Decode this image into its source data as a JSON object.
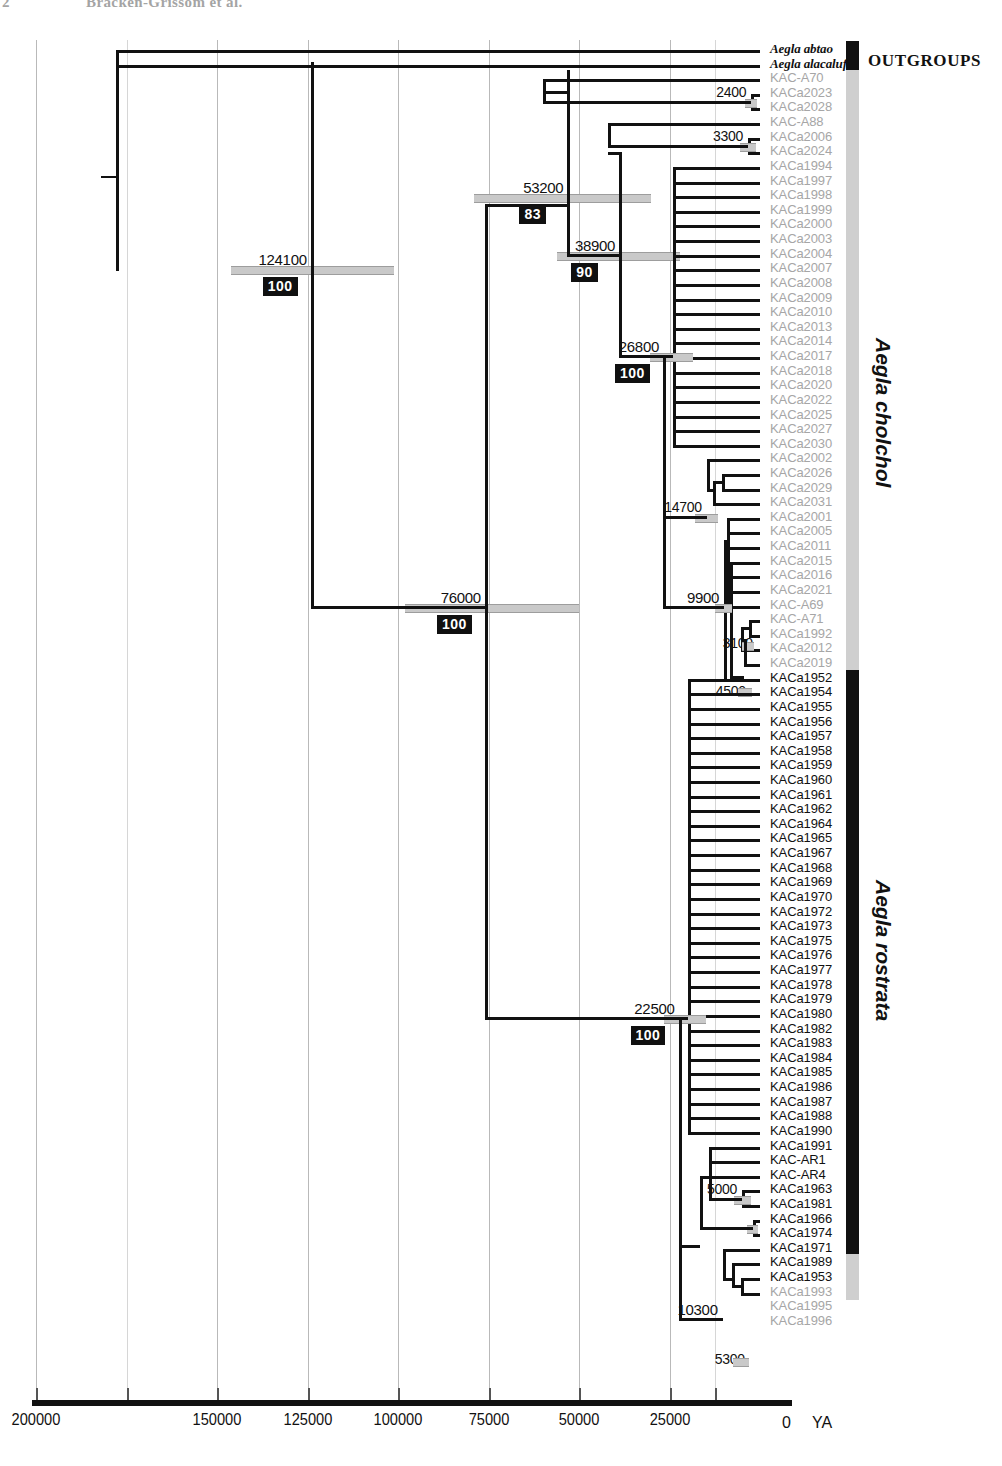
{
  "running_head": {
    "page_number": "2",
    "text": "Bracken-Grissom et al."
  },
  "figure": {
    "type": "phylogenetic-time-tree",
    "axis": {
      "unit_label": "YA",
      "zero_label": "0",
      "ticks": [
        {
          "label": "200000",
          "value": 200000
        },
        {
          "label": "150000",
          "value": 150000
        },
        {
          "label": "125000",
          "value": 125000
        },
        {
          "label": "100000",
          "value": 100000
        },
        {
          "label": "75000",
          "value": 75000
        },
        {
          "label": "50000",
          "value": 50000
        },
        {
          "label": "25000",
          "value": 25000
        }
      ],
      "min": 0,
      "max": 200000,
      "direction": "right-to-left-past-to-present"
    },
    "clades": [
      {
        "name": "OUTGROUPS",
        "label": "OUTGROUPS",
        "bar_color": "#111111",
        "orientation": "horizontal"
      },
      {
        "name": "Aegla cholchol",
        "label": "Aegla cholchol",
        "bar_color": "#cfcfcf",
        "orientation": "vertical"
      },
      {
        "name": "Aegla rostrata",
        "label": "Aegla rostrata",
        "bar_color": "#111111",
        "orientation": "vertical"
      }
    ],
    "node_ages": [
      {
        "id": "root",
        "label": "124100",
        "support": "100"
      },
      {
        "id": "cholchol-stem",
        "label": "53200",
        "support": "83"
      },
      {
        "id": "cholchol-core",
        "label": "38900",
        "support": "90"
      },
      {
        "id": "cholchol-sub",
        "label": "26800",
        "support": "100"
      },
      {
        "id": "cholchol-rostrata-split",
        "label": "76000",
        "support": "100"
      },
      {
        "id": "rostrata-crown",
        "label": "22500",
        "support": "100"
      },
      {
        "id": "node-2400",
        "label": "2400",
        "support": ""
      },
      {
        "id": "node-3300",
        "label": "3300",
        "support": ""
      },
      {
        "id": "node-14700",
        "label": "14700",
        "support": ""
      },
      {
        "id": "node-9900",
        "label": "9900",
        "support": ""
      },
      {
        "id": "node-3100",
        "label": "3100",
        "support": ""
      },
      {
        "id": "node-4500",
        "label": "4500",
        "support": ""
      },
      {
        "id": "node-5000",
        "label": "5000",
        "support": ""
      },
      {
        "id": "node-10300",
        "label": "10300",
        "support": ""
      },
      {
        "id": "node-5300",
        "label": "5300",
        "support": ""
      }
    ],
    "tips": [
      {
        "label": "Aegla abtao",
        "style": "outgroup"
      },
      {
        "label": "Aegla alacalufi",
        "style": "outgroup"
      },
      {
        "label": "KAC-A70",
        "style": "grey"
      },
      {
        "label": "KACa2023",
        "style": "grey"
      },
      {
        "label": "KACa2028",
        "style": "grey"
      },
      {
        "label": "KAC-A88",
        "style": "grey"
      },
      {
        "label": "KACa2006",
        "style": "grey"
      },
      {
        "label": "KACa2024",
        "style": "grey"
      },
      {
        "label": "KACa1994",
        "style": "grey"
      },
      {
        "label": "KACa1997",
        "style": "grey"
      },
      {
        "label": "KACa1998",
        "style": "grey"
      },
      {
        "label": "KACa1999",
        "style": "grey"
      },
      {
        "label": "KACa2000",
        "style": "grey"
      },
      {
        "label": "KACa2003",
        "style": "grey"
      },
      {
        "label": "KACa2004",
        "style": "grey"
      },
      {
        "label": "KACa2007",
        "style": "grey"
      },
      {
        "label": "KACa2008",
        "style": "grey"
      },
      {
        "label": "KACa2009",
        "style": "grey"
      },
      {
        "label": "KACa2010",
        "style": "grey"
      },
      {
        "label": "KACa2013",
        "style": "grey"
      },
      {
        "label": "KACa2014",
        "style": "grey"
      },
      {
        "label": "KACa2017",
        "style": "grey"
      },
      {
        "label": "KACa2018",
        "style": "grey"
      },
      {
        "label": "KACa2020",
        "style": "grey"
      },
      {
        "label": "KACa2022",
        "style": "grey"
      },
      {
        "label": "KACa2025",
        "style": "grey"
      },
      {
        "label": "KACa2027",
        "style": "grey"
      },
      {
        "label": "KACa2030",
        "style": "grey"
      },
      {
        "label": "KACa2002",
        "style": "grey"
      },
      {
        "label": "KACa2026",
        "style": "grey"
      },
      {
        "label": "KACa2029",
        "style": "grey"
      },
      {
        "label": "KACa2031",
        "style": "grey"
      },
      {
        "label": "KACa2001",
        "style": "grey"
      },
      {
        "label": "KACa2005",
        "style": "grey"
      },
      {
        "label": "KACa2011",
        "style": "grey"
      },
      {
        "label": "KACa2015",
        "style": "grey"
      },
      {
        "label": "KACa2016",
        "style": "grey"
      },
      {
        "label": "KACa2021",
        "style": "grey"
      },
      {
        "label": "KAC-A69",
        "style": "grey"
      },
      {
        "label": "KAC-A71",
        "style": "grey"
      },
      {
        "label": "KACa1992",
        "style": "grey"
      },
      {
        "label": "KACa2012",
        "style": "grey"
      },
      {
        "label": "KACa2019",
        "style": "grey"
      },
      {
        "label": "KACa1952",
        "style": "black"
      },
      {
        "label": "KACa1954",
        "style": "black"
      },
      {
        "label": "KACa1955",
        "style": "black"
      },
      {
        "label": "KACa1956",
        "style": "black"
      },
      {
        "label": "KACa1957",
        "style": "black"
      },
      {
        "label": "KACa1958",
        "style": "black"
      },
      {
        "label": "KACa1959",
        "style": "black"
      },
      {
        "label": "KACa1960",
        "style": "black"
      },
      {
        "label": "KACa1961",
        "style": "black"
      },
      {
        "label": "KACa1962",
        "style": "black"
      },
      {
        "label": "KACa1964",
        "style": "black"
      },
      {
        "label": "KACa1965",
        "style": "black"
      },
      {
        "label": "KACa1967",
        "style": "black"
      },
      {
        "label": "KACa1968",
        "style": "black"
      },
      {
        "label": "KACa1969",
        "style": "black"
      },
      {
        "label": "KACa1970",
        "style": "black"
      },
      {
        "label": "KACa1972",
        "style": "black"
      },
      {
        "label": "KACa1973",
        "style": "black"
      },
      {
        "label": "KACa1975",
        "style": "black"
      },
      {
        "label": "KACa1976",
        "style": "black"
      },
      {
        "label": "KACa1977",
        "style": "black"
      },
      {
        "label": "KACa1978",
        "style": "black"
      },
      {
        "label": "KACa1979",
        "style": "black"
      },
      {
        "label": "KACa1980",
        "style": "black"
      },
      {
        "label": "KACa1982",
        "style": "black"
      },
      {
        "label": "KACa1983",
        "style": "black"
      },
      {
        "label": "KACa1984",
        "style": "black"
      },
      {
        "label": "KACa1985",
        "style": "black"
      },
      {
        "label": "KACa1986",
        "style": "black"
      },
      {
        "label": "KACa1987",
        "style": "black"
      },
      {
        "label": "KACa1988",
        "style": "black"
      },
      {
        "label": "KACa1990",
        "style": "black"
      },
      {
        "label": "KACa1991",
        "style": "black"
      },
      {
        "label": "KAC-AR1",
        "style": "black"
      },
      {
        "label": "KAC-AR4",
        "style": "black"
      },
      {
        "label": "KACa1963",
        "style": "black"
      },
      {
        "label": "KACa1981",
        "style": "black"
      },
      {
        "label": "KACa1966",
        "style": "black"
      },
      {
        "label": "KACa1974",
        "style": "black"
      },
      {
        "label": "KACa1971",
        "style": "black"
      },
      {
        "label": "KACa1989",
        "style": "black"
      },
      {
        "label": "KACa1953",
        "style": "black"
      },
      {
        "label": "KACa1993",
        "style": "grey"
      },
      {
        "label": "KACa1995",
        "style": "grey"
      },
      {
        "label": "KACa1996",
        "style": "grey"
      }
    ]
  }
}
